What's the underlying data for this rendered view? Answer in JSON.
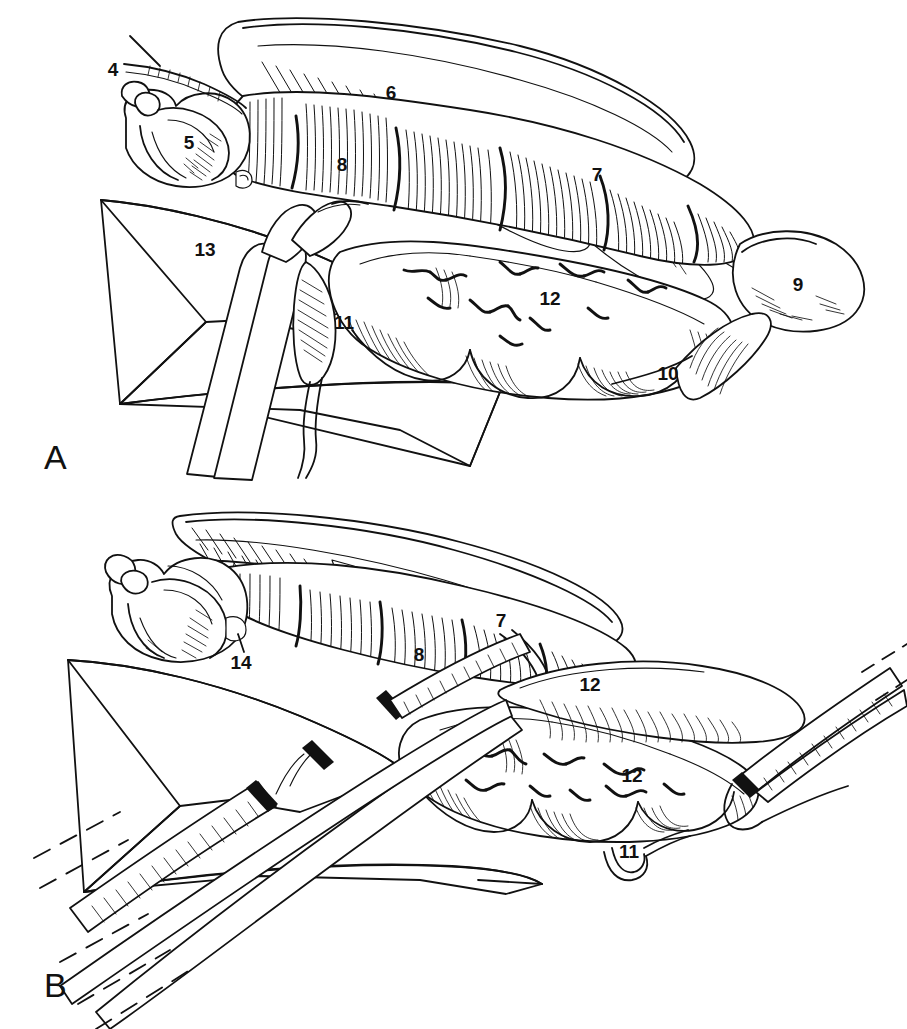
{
  "figure": {
    "kind": "surgical-anatomy-line-drawing",
    "background_color": "#ffffff",
    "ink_color": "#111111",
    "width": 907,
    "height": 1029
  },
  "panels": [
    {
      "id": "panel-a",
      "letter": "A",
      "letter_x": 44,
      "letter_y": 440,
      "callouts": [
        {
          "id": "a-4",
          "text": "4",
          "x": 113,
          "y": 69
        },
        {
          "id": "a-6",
          "text": "6",
          "x": 391,
          "y": 92
        },
        {
          "id": "a-5",
          "text": "5",
          "x": 189,
          "y": 142
        },
        {
          "id": "a-8",
          "text": "8",
          "x": 342,
          "y": 164
        },
        {
          "id": "a-7",
          "text": "7",
          "x": 597,
          "y": 174
        },
        {
          "id": "a-13",
          "text": "13",
          "x": 205,
          "y": 249
        },
        {
          "id": "a-9",
          "text": "9",
          "x": 798,
          "y": 284
        },
        {
          "id": "a-12",
          "text": "12",
          "x": 550,
          "y": 298
        },
        {
          "id": "a-11",
          "text": "11",
          "x": 344,
          "y": 322
        },
        {
          "id": "a-10",
          "text": "10",
          "x": 668,
          "y": 373
        }
      ]
    },
    {
      "id": "panel-b",
      "letter": "B",
      "letter_x": 44,
      "letter_y": 968,
      "callouts": [
        {
          "id": "b-7",
          "text": "7",
          "x": 501,
          "y": 620
        },
        {
          "id": "b-14",
          "text": "14",
          "x": 241,
          "y": 662
        },
        {
          "id": "b-8",
          "text": "8",
          "x": 419,
          "y": 654
        },
        {
          "id": "b-12a",
          "text": "12",
          "x": 590,
          "y": 684
        },
        {
          "id": "b-12b",
          "text": "12",
          "x": 632,
          "y": 775
        },
        {
          "id": "b-11",
          "text": "11",
          "x": 629,
          "y": 851
        }
      ]
    }
  ],
  "legend_keys": [
    "4",
    "5",
    "6",
    "7",
    "8",
    "9",
    "10",
    "11",
    "12",
    "13",
    "14"
  ]
}
